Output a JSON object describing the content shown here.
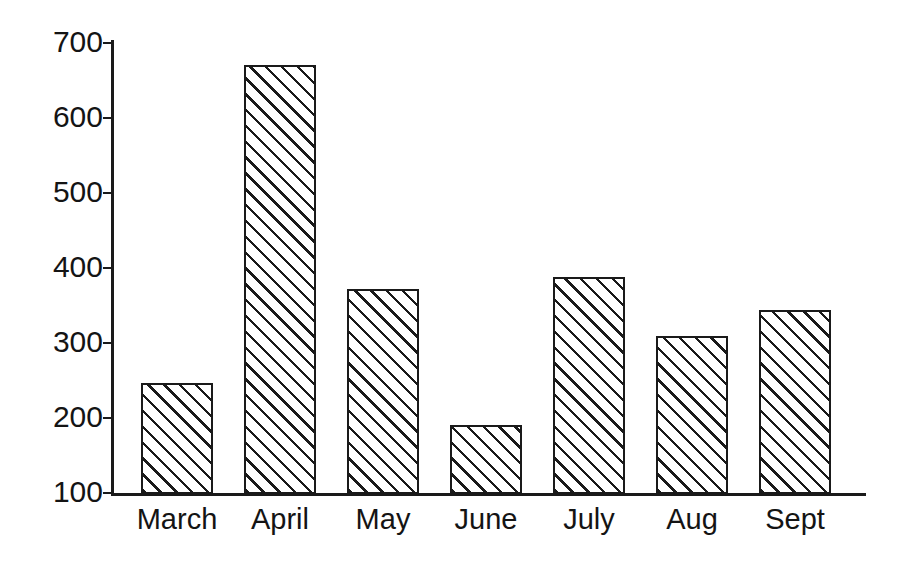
{
  "chart_data": {
    "type": "bar",
    "title": "",
    "subtitle": "",
    "xlabel": "",
    "ylabel": "",
    "categories": [
      "March",
      "April",
      "May",
      "June",
      "July",
      "Aug",
      "Sept"
    ],
    "values": [
      248,
      670,
      372,
      192,
      388,
      310,
      344
    ],
    "series": [
      {
        "name": "",
        "values": [
          248,
          670,
          372,
          192,
          388,
          310,
          344
        ]
      }
    ],
    "ylim": [
      100,
      700
    ],
    "yticks": [
      700,
      600,
      500,
      400,
      300,
      200,
      100
    ],
    "ytick_labels": [
      "700",
      "600",
      "500",
      "400",
      "300",
      "200",
      "100"
    ],
    "grid": false,
    "legend": false,
    "legend_position": "none",
    "annotations": [],
    "bar_fill": "diagonal-hatch",
    "bar_edge_color": "#1a1a1a",
    "bar_face_color": "#ffffff",
    "axis_color": "#1a1a1a",
    "background_color": "#ffffff"
  }
}
